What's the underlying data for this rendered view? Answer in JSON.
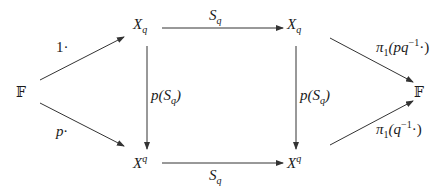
{
  "diagram": {
    "type": "commutative-diagram",
    "nodes": {
      "left_field": {
        "text": "𝔽"
      },
      "top_left": {
        "base": "X",
        "sub": "q"
      },
      "top_right": {
        "base": "X",
        "sub": "q"
      },
      "bottom_left": {
        "base": "X",
        "sup": "q"
      },
      "bottom_right": {
        "base": "X",
        "sup": "q"
      },
      "right_field": {
        "text": "𝔽"
      }
    },
    "arrows": [
      {
        "from": "left_field",
        "to": "top_left",
        "label": "1·"
      },
      {
        "from": "left_field",
        "to": "bottom_left",
        "label": "p·"
      },
      {
        "from": "top_left",
        "to": "top_right",
        "label_base": "S",
        "label_sub": "q"
      },
      {
        "from": "bottom_left",
        "to": "bottom_right",
        "label_base": "S",
        "label_sub": "q"
      },
      {
        "from": "top_left",
        "to": "bottom_left",
        "label_pre": "p(S",
        "label_sub": "q",
        "label_post": ")"
      },
      {
        "from": "top_right",
        "to": "bottom_right",
        "label_pre": "p(S",
        "label_sub": "q",
        "label_post": ")"
      },
      {
        "from": "top_right",
        "to": "right_field",
        "label_pre": "π",
        "label_sub": "1",
        "label_mid": "(pq",
        "label_sup": "−1",
        "label_post": "·)"
      },
      {
        "from": "bottom_right",
        "to": "right_field",
        "label_pre": "π",
        "label_sub": "1",
        "label_mid": "(q",
        "label_sup": "−1",
        "label_post": "·)"
      }
    ],
    "line_color": "#333333"
  }
}
